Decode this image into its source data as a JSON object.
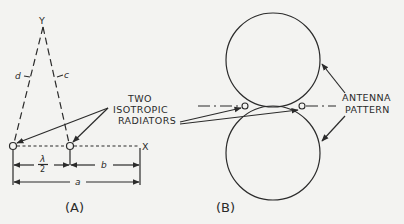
{
  "figure": {
    "panel_a": {
      "label": "(A)",
      "apex_label": "Y",
      "axis_label": "X",
      "left_edge_label": "d",
      "right_edge_label": "c",
      "half_wave_numerator": "λ",
      "half_wave_denominator": "2",
      "dimension_b_label": "b",
      "dimension_a_label": "a"
    },
    "panel_b": {
      "label": "(B)",
      "pattern_label_line1": "ANTENNA",
      "pattern_label_line2": "PATTERN"
    },
    "radiators_label": {
      "line1": "TWO",
      "line2": "ISOTROPIC",
      "line3": "RADIATORS"
    }
  }
}
